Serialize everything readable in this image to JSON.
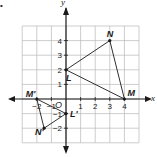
{
  "bullet": "•",
  "axes": {
    "x_label": "x",
    "y_label": "y",
    "origin_label": "O"
  },
  "grid": {
    "x_range": [
      -3,
      5
    ],
    "y_range": [
      -3,
      5
    ]
  },
  "x_ticks": [
    {
      "value": -2,
      "label": "−2"
    },
    {
      "value": -1,
      "label": "−1"
    },
    {
      "value": 1,
      "label": "1"
    },
    {
      "value": 2,
      "label": "2"
    },
    {
      "value": 3,
      "label": "3"
    },
    {
      "value": 4,
      "label": "4"
    }
  ],
  "y_ticks": [
    {
      "value": 4,
      "label": "4"
    },
    {
      "value": 3,
      "label": "3"
    },
    {
      "value": 2,
      "label": "2"
    },
    {
      "value": 1,
      "label": "1"
    },
    {
      "value": -1,
      "label": "−1"
    },
    {
      "value": -2,
      "label": "−2"
    }
  ],
  "triangles": [
    {
      "name": "LMN",
      "points": [
        {
          "label": "L",
          "x": 0,
          "y": 2
        },
        {
          "label": "N",
          "x": 3,
          "y": 4
        },
        {
          "label": "M",
          "x": 4,
          "y": 0
        }
      ]
    },
    {
      "name": "L'M'N'",
      "points": [
        {
          "label": "L'",
          "x": 0,
          "y": -1
        },
        {
          "label": "M'",
          "x": -2,
          "y": 0
        },
        {
          "label": "N'",
          "x": -1.5,
          "y": -2
        }
      ]
    }
  ]
}
